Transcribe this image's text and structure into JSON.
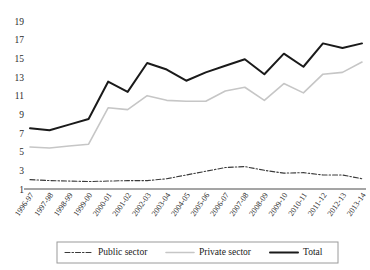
{
  "chart_data": {
    "type": "line",
    "title": "",
    "subtitle": "",
    "xlabel": "",
    "ylabel": "",
    "ylim": [
      1,
      19
    ],
    "ytick_values": [
      1,
      3,
      5,
      7,
      9,
      11,
      13,
      15,
      17,
      19
    ],
    "grid": false,
    "legend_position": "bottom",
    "categories": [
      "1996-97",
      "1997-98",
      "1998-99",
      "1999-00",
      "2000-01",
      "2001-02",
      "2002-03",
      "2003-04",
      "2004-05",
      "2005-06",
      "2006-07",
      "2007-08",
      "2008-09",
      "2009-10",
      "2010-11",
      "2011-12",
      "2012-13",
      "2013-14"
    ],
    "series": [
      {
        "name": "Public sector",
        "style": "dash-dot",
        "color": "#3a3a3a",
        "values": [
          2.0,
          1.9,
          1.85,
          1.8,
          1.85,
          1.9,
          1.9,
          2.1,
          2.5,
          2.9,
          3.3,
          3.4,
          3.0,
          2.7,
          2.75,
          2.5,
          2.5,
          2.1
        ]
      },
      {
        "name": "Private sector",
        "style": "solid-light",
        "color": "#c6c6c6",
        "values": [
          5.5,
          5.4,
          5.6,
          5.8,
          9.7,
          9.5,
          11.0,
          10.5,
          10.4,
          10.4,
          11.5,
          11.9,
          10.5,
          12.3,
          11.3,
          13.3,
          13.5,
          14.6
        ]
      },
      {
        "name": "Total",
        "style": "solid-bold",
        "color": "#1a1a1a",
        "values": [
          7.5,
          7.3,
          7.9,
          8.5,
          12.5,
          11.4,
          14.5,
          13.8,
          12.6,
          13.5,
          14.2,
          14.9,
          13.3,
          15.5,
          14.1,
          16.6,
          16.1,
          16.6
        ]
      }
    ]
  },
  "legend": {
    "items": [
      {
        "label": "Public sector"
      },
      {
        "label": "Private sector"
      },
      {
        "label": "Total"
      }
    ]
  }
}
